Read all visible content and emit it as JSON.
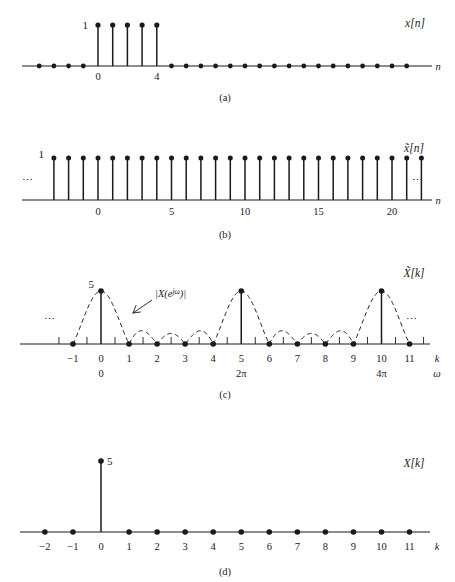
{
  "figure": {
    "panel_letters": [
      "(a)",
      "(b)",
      "(c)",
      "(d)"
    ],
    "ellipsis": "⋯"
  },
  "panels": {
    "a": {
      "letter": "(a)",
      "signal_label": "x[n]",
      "axis_label": "n",
      "amplitude_label": "1",
      "tick_labels": [
        "0",
        "4"
      ],
      "tick_positions": [
        0,
        4
      ]
    },
    "b": {
      "letter": "(b)",
      "signal_label": "x̃[n]",
      "axis_label": "n",
      "amplitude_label": "1",
      "tick_labels": [
        "0",
        "5",
        "10",
        "15",
        "20"
      ],
      "tick_positions": [
        0,
        5,
        10,
        15,
        20
      ],
      "left_ellipsis": "⋯",
      "right_ellipsis": "⋯"
    },
    "c": {
      "letter": "(c)",
      "signal_label": "X̃[k]",
      "axis_label": "k",
      "omega_axis_label": "ω",
      "amplitude_label": "5",
      "envelope_label": "|X(eʲᵕ)|",
      "envelope_label_parts": {
        "prefix": "|X(e",
        "exponent": "jω",
        "suffix": ")|"
      },
      "tick_labels": [
        "−1",
        "0",
        "1",
        "2",
        "3",
        "4",
        "5",
        "6",
        "7",
        "8",
        "9",
        "10",
        "11"
      ],
      "tick_positions": [
        -1,
        0,
        1,
        2,
        3,
        4,
        5,
        6,
        7,
        8,
        9,
        10,
        11
      ],
      "omega_labels": [
        "0",
        "2π",
        "4π"
      ],
      "omega_label_positions": [
        0,
        5,
        10
      ],
      "left_ellipsis": "⋯",
      "right_ellipsis": "⋯"
    },
    "d": {
      "letter": "(d)",
      "signal_label": "X[k]",
      "axis_label": "k",
      "amplitude_label": "5",
      "tick_labels": [
        "−2",
        "−1",
        "0",
        "1",
        "2",
        "3",
        "4",
        "5",
        "6",
        "7",
        "8",
        "9",
        "10",
        "11"
      ],
      "tick_positions": [
        -2,
        -1,
        0,
        1,
        2,
        3,
        4,
        5,
        6,
        7,
        8,
        9,
        10,
        11
      ]
    }
  },
  "chart_data": [
    {
      "type": "line",
      "panel": "a",
      "title": "x[n]",
      "xlabel": "n",
      "ylabel": "",
      "plot_style": "stem",
      "xlim": [
        -5,
        23
      ],
      "ylim": [
        0,
        1.25
      ],
      "x": [
        -5,
        -4,
        -3,
        -2,
        -1,
        0,
        1,
        2,
        3,
        4,
        5,
        6,
        7,
        8,
        9,
        10,
        11,
        12,
        13,
        14,
        15,
        16,
        17,
        18,
        19,
        20,
        21,
        22,
        23
      ],
      "values": [
        0,
        0,
        0,
        0,
        0,
        1,
        1,
        1,
        1,
        1,
        0,
        0,
        0,
        0,
        0,
        0,
        0,
        0,
        0,
        0,
        0,
        0,
        0,
        0,
        0,
        0,
        0,
        0,
        0
      ],
      "annotations": [
        "1",
        "0",
        "4"
      ],
      "grid": false,
      "legend": "none"
    },
    {
      "type": "line",
      "panel": "b",
      "title": "x̃[n]",
      "xlabel": "n",
      "ylabel": "",
      "plot_style": "stem",
      "description": "periodic extension of x[n] with period 5; all displayed samples equal 1",
      "xlim": [
        -3.5,
        22.5
      ],
      "ylim": [
        0,
        1.25
      ],
      "x": [
        -3,
        -2,
        -1,
        0,
        1,
        2,
        3,
        4,
        5,
        6,
        7,
        8,
        9,
        10,
        11,
        12,
        13,
        14,
        15,
        16,
        17,
        18,
        19,
        20,
        21,
        22
      ],
      "values": [
        1,
        1,
        1,
        1,
        1,
        1,
        1,
        1,
        1,
        1,
        1,
        1,
        1,
        1,
        1,
        1,
        1,
        1,
        1,
        1,
        1,
        1,
        1,
        1,
        1,
        1
      ],
      "annotations": [
        "1",
        "⋯",
        "⋯"
      ],
      "grid": false,
      "legend": "none"
    },
    {
      "type": "line",
      "panel": "c",
      "title": "X̃[k]",
      "xlabel": "k",
      "ylabel": "",
      "plot_style": "stem-with-envelope",
      "description": "DFS coefficients of x̃[n], equal to 5 at k = 0, 5, 10 and 0 elsewhere, shown with the dashed DTFT magnitude envelope |X(e^{jω})| = |sin(5ω/2)/sin(ω/2)|",
      "xlim": [
        -1.6,
        11.6
      ],
      "ylim": [
        0,
        5.4
      ],
      "x": [
        -1,
        0,
        1,
        2,
        3,
        4,
        5,
        6,
        7,
        8,
        9,
        10,
        11
      ],
      "values": [
        0,
        5,
        0,
        0,
        0,
        0,
        5,
        0,
        0,
        0,
        0,
        5,
        0
      ],
      "series": [
        {
          "name": "X̃[k]",
          "values": [
            0,
            5,
            0,
            0,
            0,
            0,
            5,
            0,
            0,
            0,
            0,
            5,
            0
          ]
        },
        {
          "name": "|X(eʲᵕ)|",
          "peak": 5,
          "sidelobe_peaks": [
            1.12,
            1.0,
            1.0,
            1.12
          ],
          "zeros": [
            -1,
            1,
            2,
            3,
            4,
            6,
            7,
            8,
            9,
            11
          ]
        }
      ],
      "secondary_axis": {
        "label": "ω",
        "ticks": [
          {
            "k": 0,
            "label": "0"
          },
          {
            "k": 5,
            "label": "2π"
          },
          {
            "k": 10,
            "label": "4π"
          }
        ]
      },
      "annotations": [
        "5",
        "|X(eʲᵕ)|",
        "⋯",
        "⋯"
      ],
      "grid": false,
      "legend": "none"
    },
    {
      "type": "line",
      "panel": "d",
      "title": "X[k]",
      "xlabel": "k",
      "ylabel": "",
      "plot_style": "stem",
      "description": "finite-length DFT X[k]; single nonzero value 5 at k = 0",
      "xlim": [
        -2.6,
        11.8
      ],
      "ylim": [
        0,
        5.4
      ],
      "x": [
        -2,
        -1,
        0,
        1,
        2,
        3,
        4,
        5,
        6,
        7,
        8,
        9,
        10,
        11
      ],
      "values": [
        0,
        0,
        5,
        0,
        0,
        0,
        0,
        0,
        0,
        0,
        0,
        0,
        0,
        0
      ],
      "annotations": [
        "5"
      ],
      "grid": false,
      "legend": "none"
    }
  ]
}
